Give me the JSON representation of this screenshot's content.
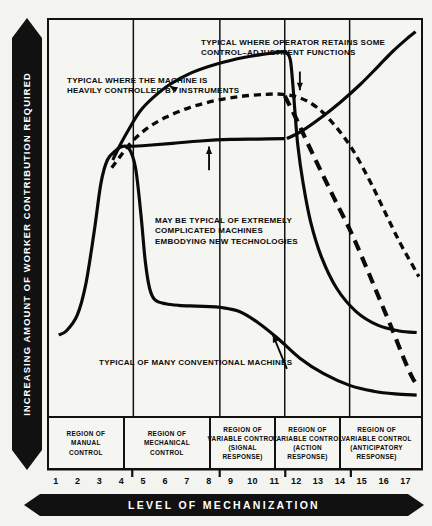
{
  "axes": {
    "y_label": "INCREASING  AMOUNT  OF  WORKER  CONTRIBUTION  REQUIRED",
    "x_label": "LEVEL OF MECHANIZATION"
  },
  "annotations": {
    "a": "TYPICAL WHERE THE MACHINE IS\nHEAVILY CONTROLLED BY INSTRUMENTS",
    "b": "TYPICAL WHERE OPERATOR RETAINS SOME\nCONTROL–ADJUSTMENT FUNCTIONS",
    "c": "MAY BE TYPICAL OF EXTREMELY\nCOMPLICATED MACHINES\nEMBODYING NEW TECHNOLOGIES",
    "d": "TYPICAL OF MANY CONVENTIONAL MACHINES"
  },
  "regions": [
    {
      "label": "REGION OF\nMANUAL\nCONTROL",
      "from": 1,
      "to": 4.5
    },
    {
      "label": "REGION OF\nMECHANICAL\nCONTROL",
      "from": 4.5,
      "to": 8.5
    },
    {
      "label": "REGION OF\nVARIABLE CONTROL\n(SIGNAL\nRESPONSE)",
      "from": 8.5,
      "to": 11.5
    },
    {
      "label": "REGION OF\nVARIABLE CONTROL\n(ACTION\nRESPONSE)",
      "from": 11.5,
      "to": 14.5
    },
    {
      "label": "REGION OF\nVARIABLE CONTROL\n(ANTICIPATORY\nRESPONSE)",
      "from": 14.5,
      "to": 17.8
    }
  ],
  "chart_data": {
    "type": "line",
    "title": "",
    "xlabel": "LEVEL OF MECHANIZATION",
    "ylabel": "INCREASING AMOUNT OF WORKER CONTRIBUTION REQUIRED",
    "xlim": [
      0.6,
      17.8
    ],
    "ylim": [
      0,
      100
    ],
    "grid": false,
    "legend": "none",
    "x_ticks": [
      1,
      2,
      3,
      4,
      5,
      6,
      7,
      8,
      9,
      10,
      11,
      12,
      13,
      14,
      15,
      16,
      17
    ],
    "x_tick_labels": [
      "1",
      "2",
      "3",
      "4",
      "5",
      "6",
      "7",
      "8",
      "9",
      "10",
      "11",
      "12",
      "13",
      "14",
      "15",
      "16",
      "17"
    ],
    "y_ticks": [],
    "region_boundaries": [
      4.5,
      8.5,
      11.5,
      14.5
    ],
    "series": [
      {
        "name": "TYPICAL OF MANY CONVENTIONAL MACHINES",
        "style": "solid",
        "annotation": "d",
        "points": [
          [
            1.05,
            21
          ],
          [
            1.4,
            22
          ],
          [
            1.9,
            26
          ],
          [
            2.3,
            34
          ],
          [
            2.7,
            48
          ],
          [
            3.0,
            60
          ],
          [
            3.3,
            66
          ],
          [
            3.7,
            68.5
          ],
          [
            4.0,
            69.5
          ],
          [
            4.3,
            69
          ],
          [
            4.6,
            64
          ],
          [
            4.85,
            52
          ],
          [
            5.05,
            40
          ],
          [
            5.25,
            33
          ],
          [
            5.5,
            30
          ],
          [
            6.0,
            29
          ],
          [
            6.6,
            28.6
          ],
          [
            7.4,
            28.4
          ],
          [
            8.3,
            28.2
          ],
          [
            8.5,
            28.1
          ]
        ]
      },
      {
        "name": "TYPICAL WHERE THE MACHINE IS HEAVILY CONTROLLED BY INSTRUMENTS",
        "style": "solid",
        "annotation": "a",
        "points": [
          [
            3.55,
            66
          ],
          [
            3.9,
            70
          ],
          [
            4.3,
            74
          ],
          [
            4.8,
            78.5
          ],
          [
            5.4,
            82
          ],
          [
            6.2,
            85.5
          ],
          [
            7.2,
            88.5
          ],
          [
            8.4,
            90.8
          ],
          [
            9.6,
            92.4
          ],
          [
            10.6,
            93.3
          ],
          [
            11.2,
            93.7
          ],
          [
            11.55,
            93.8
          ],
          [
            11.75,
            92
          ],
          [
            11.85,
            87
          ],
          [
            11.95,
            80
          ],
          [
            12.1,
            70
          ],
          [
            12.35,
            60
          ],
          [
            12.7,
            50
          ],
          [
            13.2,
            41
          ],
          [
            13.9,
            33
          ],
          [
            14.8,
            27
          ],
          [
            15.8,
            23.5
          ],
          [
            16.8,
            22
          ],
          [
            17.6,
            21.6
          ]
        ]
      },
      {
        "name": "MAY BE TYPICAL OF EXTREMELY COMPLICATED MACHINES EMBODYING NEW TECHNOLOGIES",
        "style": "dashed-short",
        "annotation": "c",
        "points": [
          [
            3.5,
            64
          ],
          [
            3.9,
            67
          ],
          [
            4.4,
            70.5
          ],
          [
            5.1,
            74
          ],
          [
            6.0,
            77
          ],
          [
            7.1,
            79.5
          ],
          [
            8.3,
            81.3
          ],
          [
            9.5,
            82.4
          ],
          [
            10.6,
            82.9
          ],
          [
            11.4,
            82.9
          ],
          [
            12.2,
            82
          ],
          [
            13.0,
            79.5
          ],
          [
            13.8,
            75
          ],
          [
            14.6,
            69
          ],
          [
            15.4,
            61
          ],
          [
            16.1,
            53
          ],
          [
            16.8,
            45
          ],
          [
            17.4,
            39
          ],
          [
            17.7,
            36
          ]
        ]
      },
      {
        "name": "TYPICAL WHERE OPERATOR RETAINS SOME CONTROL-ADJUSTMENT FUNCTIONS",
        "style": "dashed-long",
        "annotation": "b",
        "points": [
          [
            11.5,
            82.5
          ],
          [
            12.0,
            77
          ],
          [
            12.5,
            71
          ],
          [
            13.1,
            64
          ],
          [
            13.8,
            56
          ],
          [
            14.6,
            47
          ],
          [
            15.3,
            38
          ],
          [
            15.9,
            30
          ],
          [
            16.5,
            22
          ],
          [
            17.0,
            15
          ],
          [
            17.4,
            10
          ],
          [
            17.7,
            7.5
          ]
        ]
      },
      {
        "name": "rising-solid-upper-right",
        "style": "solid",
        "points": [
          [
            11.6,
            71.5
          ],
          [
            12.3,
            73.5
          ],
          [
            13.2,
            77
          ],
          [
            14.1,
            81
          ],
          [
            15.0,
            85.5
          ],
          [
            15.8,
            90
          ],
          [
            16.5,
            94
          ],
          [
            17.1,
            97
          ],
          [
            17.55,
            99
          ]
        ]
      },
      {
        "name": "lower-right-descending-solid",
        "style": "solid",
        "points": [
          [
            8.5,
            28.1
          ],
          [
            9.4,
            27
          ],
          [
            10.3,
            24
          ],
          [
            11.2,
            20
          ],
          [
            12.2,
            15
          ],
          [
            13.3,
            11
          ],
          [
            14.5,
            8
          ],
          [
            15.6,
            6.5
          ],
          [
            16.6,
            5.8
          ],
          [
            17.6,
            5.5
          ]
        ]
      },
      {
        "name": "mid-right-solid-plateau",
        "style": "solid",
        "points": [
          [
            4.3,
            69.5
          ],
          [
            5.2,
            69.8
          ],
          [
            6.3,
            70.3
          ],
          [
            7.6,
            70.9
          ],
          [
            9.0,
            71.3
          ],
          [
            10.3,
            71.4
          ],
          [
            11.5,
            71.5
          ]
        ]
      }
    ],
    "arrow_annotations": [
      {
        "from": "a",
        "to_x": 6.2,
        "to_y": 85.0
      },
      {
        "from": "b",
        "to_x": 12.2,
        "to_y": 83.2
      },
      {
        "from": "c",
        "to_x": 8.0,
        "to_y": 71.0
      },
      {
        "from": "d",
        "to_x": 11.0,
        "to_y": 21.5
      }
    ]
  }
}
